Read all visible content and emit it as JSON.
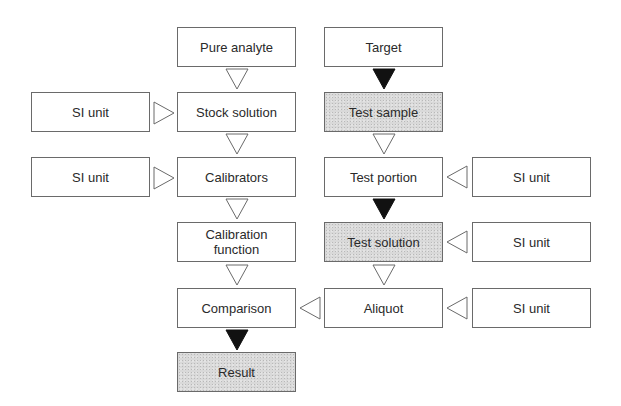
{
  "diagram": {
    "left_column": {
      "pure_analyte": "Pure analyte",
      "stock_solution": "Stock solution",
      "calibrators": "Calibrators",
      "calibration_function": "Calibration function",
      "comparison": "Comparison",
      "result": "Result"
    },
    "right_column": {
      "target": "Target",
      "test_sample": "Test sample",
      "test_portion": "Test portion",
      "test_solution": "Test solution",
      "aliquot": "Aliquot"
    },
    "si_units": {
      "stock": "SI unit",
      "calibrators": "SI unit",
      "test_portion": "SI unit",
      "test_solution": "SI unit",
      "aliquot": "SI unit"
    },
    "colors": {
      "box_border": "#6a6a6a",
      "shaded_fill": "#d9d9d9",
      "solid_arrow": "#111111",
      "open_arrow_stroke": "#6a6a6a"
    },
    "legend_semantics": {
      "open_arrow": "Traceable step",
      "solid_arrow": "Sampling / transfer step",
      "shaded_box": "Material-dependent item"
    }
  }
}
